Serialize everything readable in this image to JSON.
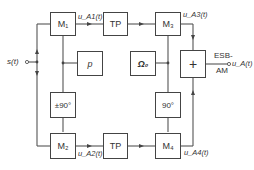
{
  "diagram": {
    "type": "block-diagram",
    "input": {
      "label": "s(t)"
    },
    "output": {
      "label": "u_A(t)",
      "block_caption_line1": "ESB-",
      "block_caption_line2": "AM"
    },
    "blocks": {
      "m1": {
        "label": "M₁"
      },
      "tp_top": {
        "label": "TP"
      },
      "m3": {
        "label": "M₃"
      },
      "p": {
        "label": "p"
      },
      "omega0": {
        "label": "Ω₀"
      },
      "sum": {
        "label": "+"
      },
      "shift_pm90": {
        "label": "±90°"
      },
      "shift_90": {
        "label": "90°"
      },
      "m2": {
        "label": "M₂"
      },
      "tp_bottom": {
        "label": "TP"
      },
      "m4": {
        "label": "M₄"
      }
    },
    "signals": {
      "ua1": "u_A1(t)",
      "ua2": "u_A2(t)",
      "ua3": "u_A3(t)",
      "ua4": "u_A4(t)"
    },
    "colors": {
      "line": "#444444",
      "text": "#333333",
      "background": "#ffffff"
    }
  }
}
